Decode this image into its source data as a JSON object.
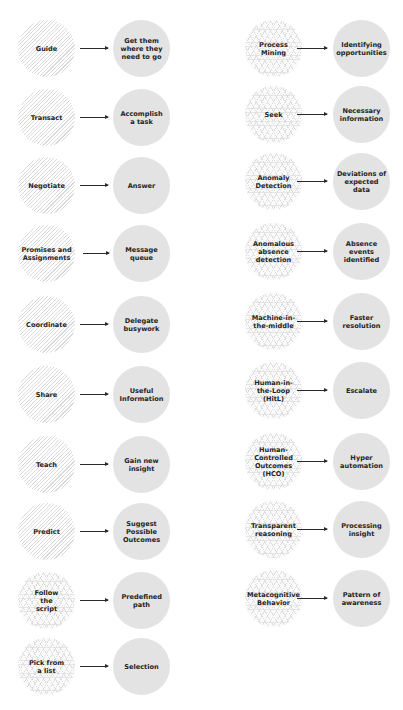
{
  "colors": {
    "target_fill": "#e3e3e3",
    "hatch_line": "#d9d9d9",
    "text": "#1f1f1f",
    "arrow": "#2a2a2a",
    "background": "#ffffff"
  },
  "left_column": [
    {
      "source": "Guide",
      "target": "Get them where they need to go",
      "pattern": "diagonal-hatch"
    },
    {
      "source": "Transact",
      "target": "Accomplish a task",
      "pattern": "diagonal-hatch"
    },
    {
      "source": "Negotiate",
      "target": "Answer",
      "pattern": "diagonal-hatch"
    },
    {
      "source": "Promises and Assignments",
      "target": "Message queue",
      "pattern": "diagonal-hatch"
    },
    {
      "source": "Coordinate",
      "target": "Delegate busywork",
      "pattern": "diagonal-hatch"
    },
    {
      "source": "Share",
      "target": "Useful Information",
      "pattern": "diagonal-hatch"
    },
    {
      "source": "Teach",
      "target": "Gain new insight",
      "pattern": "diagonal-hatch"
    },
    {
      "source": "Predict",
      "target": "Suggest Possible Outcomes",
      "pattern": "diagonal-hatch"
    },
    {
      "source": "Follow the script",
      "target": "Predefined path",
      "pattern": "cross-grid"
    },
    {
      "source": "Pick from a list",
      "target": "Selection",
      "pattern": "cross-grid"
    }
  ],
  "right_column": [
    {
      "source": "Process Mining",
      "target": "Identifying opportunities",
      "pattern": "cross-grid"
    },
    {
      "source": "Seek",
      "target": "Necessary information",
      "pattern": "cross-grid"
    },
    {
      "source": "Anomaly Detection",
      "target": "Deviations of expected data",
      "pattern": "cross-grid"
    },
    {
      "source": "Anomalous absence detection",
      "target": "Absence events identified",
      "pattern": "cross-grid"
    },
    {
      "source": "Machine-in-the-middle",
      "target": "Faster resolution",
      "pattern": "cross-grid"
    },
    {
      "source": "Human-in-the-Loop (HitL)",
      "target": "Escalate",
      "pattern": "cross-grid"
    },
    {
      "source": "Human-Controlled Outcomes (HCO)",
      "target": "Hyper automation",
      "pattern": "cross-grid"
    },
    {
      "source": "Transparent reasoning",
      "target": "Processing insight",
      "pattern": "cross-grid"
    },
    {
      "source": "Metacognitive Behavior",
      "target": "Pattern of awareness",
      "pattern": "cross-grid"
    }
  ]
}
